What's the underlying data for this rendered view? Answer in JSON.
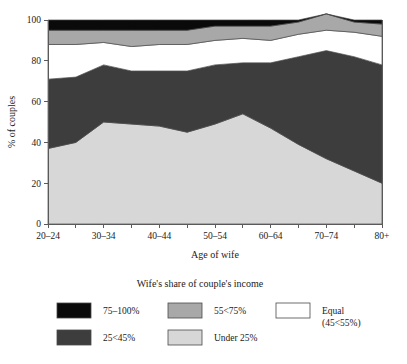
{
  "chart_data": {
    "type": "area",
    "stacked": true,
    "title": "",
    "xlabel": "Age of wife",
    "ylabel": "% of couples",
    "ylim": [
      0,
      100
    ],
    "yticks": [
      0,
      20,
      40,
      60,
      80,
      100
    ],
    "ytick_labels": [
      "0",
      "20",
      "40",
      "60",
      "80",
      "100"
    ],
    "grid": false,
    "legend_position": "below",
    "legend_title": "Wife's share of couple's income",
    "categories": [
      "20–24",
      "25–29",
      "30–34",
      "35–39",
      "40–44",
      "45–49",
      "50–54",
      "55–59",
      "60–64",
      "65–69",
      "70–74",
      "75–79",
      "80+"
    ],
    "xtick_labels_visible": [
      "20–24",
      "",
      "30–34",
      "",
      "40–44",
      "",
      "50–54",
      "",
      "60–64",
      "",
      "70–74",
      "",
      "80+"
    ],
    "series": [
      {
        "name": "Under 25%",
        "color": "#d7d7d7",
        "values": [
          37,
          40,
          50,
          49,
          48,
          45,
          49,
          54,
          47,
          39,
          32,
          26,
          20
        ]
      },
      {
        "name": "25<45%",
        "color": "#3d3d3d",
        "values": [
          34,
          32,
          28,
          26,
          27,
          30,
          29,
          25,
          32,
          43,
          53,
          56,
          58
        ]
      },
      {
        "name": "Equal (45<55%)",
        "color": "#ffffff",
        "values": [
          17,
          16,
          11,
          12,
          13,
          13,
          12,
          12,
          11,
          11,
          10,
          12,
          14
        ]
      },
      {
        "name": "55<75%",
        "color": "#a8a8a8",
        "values": [
          7,
          7,
          6,
          8,
          7,
          7,
          7,
          6,
          7,
          6,
          8,
          5,
          6
        ]
      },
      {
        "name": "75–100%",
        "color": "#0a0a0a",
        "values": [
          5,
          5,
          5,
          5,
          5,
          5,
          3,
          3,
          3,
          1,
          0,
          1,
          2
        ]
      }
    ],
    "stack_tops": {
      "note": "cumulative upper boundary of each band, bottom to top",
      "under_25": [
        37,
        40,
        50,
        49,
        48,
        45,
        49,
        54,
        47,
        39,
        32,
        26,
        20
      ],
      "band_25_45": [
        71,
        72,
        78,
        75,
        75,
        75,
        78,
        79,
        79,
        82,
        85,
        82,
        78
      ],
      "equal": [
        88,
        88,
        89,
        87,
        88,
        88,
        90,
        91,
        90,
        93,
        95,
        94,
        92
      ],
      "band_55_75": [
        95,
        95,
        95,
        95,
        95,
        95,
        97,
        97,
        97,
        99,
        95,
        99,
        98
      ],
      "band_75_100": [
        100,
        100,
        100,
        100,
        100,
        100,
        100,
        100,
        100,
        100,
        95,
        100,
        100
      ]
    }
  },
  "legend": {
    "title": "Wife's share of couple's income",
    "items": [
      {
        "label": "75–100%",
        "color": "#0a0a0a",
        "label2": ""
      },
      {
        "label": "55<75%",
        "color": "#a8a8a8",
        "label2": ""
      },
      {
        "label": "Equal",
        "color": "#ffffff",
        "label2": "(45<55%)"
      },
      {
        "label": "25<45%",
        "color": "#3d3d3d",
        "label2": ""
      },
      {
        "label": "Under 25%",
        "color": "#d7d7d7",
        "label2": ""
      }
    ]
  },
  "axes": {
    "y_title": "% of couples",
    "x_title": "Age of wife"
  }
}
